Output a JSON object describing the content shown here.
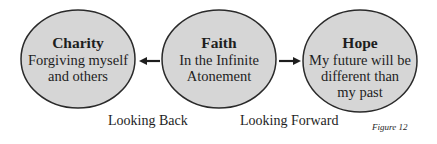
{
  "nodes": [
    {
      "id": "charity",
      "title": "Charity",
      "description": "Forgiving myself\nand others"
    },
    {
      "id": "faith",
      "title": "Faith",
      "description": "In the Infinite\nAtonement"
    },
    {
      "id": "hope",
      "title": "Hope",
      "description": "My future will be\ndifferent than\nmy past"
    }
  ],
  "edges": [
    {
      "from": "faith",
      "to": "charity",
      "label": "Looking Back"
    },
    {
      "from": "faith",
      "to": "hope",
      "label": "Looking Forward"
    }
  ],
  "figure_label": "Figure 12",
  "colors": {
    "node_fill": "#d6d6d6",
    "node_stroke": "#2a2a2a",
    "arrow": "#1e1e1e",
    "text": "#1e1e1e"
  }
}
